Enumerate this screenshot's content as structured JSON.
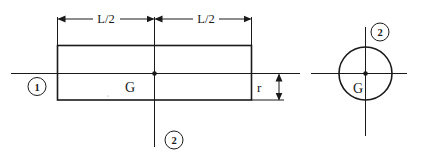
{
  "diagram": {
    "type": "engineering-drawing",
    "side_view": {
      "dimension_left_label": "L/2",
      "dimension_right_label": "L/2",
      "center_label": "G",
      "radius_label": "r",
      "axis_1_label": "1",
      "axis_2_label": "2"
    },
    "end_view": {
      "center_label": "G",
      "axis_2_label": "2"
    },
    "colors": {
      "line": "#1a1a1a",
      "background": "#ffffff"
    }
  }
}
